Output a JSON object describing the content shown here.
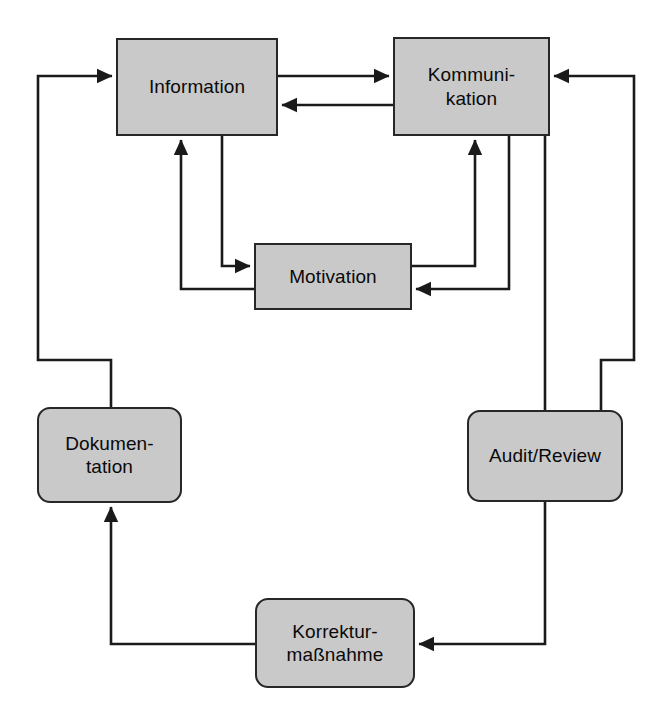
{
  "diagram": {
    "canvas": {
      "width": 656,
      "height": 722
    },
    "colors": {
      "node_fill": "#c9c9c9",
      "node_border": "#272727",
      "edge": "#1a1a1a",
      "background": "#ffffff"
    },
    "nodes": [
      {
        "id": "information",
        "label": "Information",
        "shape": "rectangle",
        "x": 116,
        "y": 38,
        "w": 162,
        "h": 98
      },
      {
        "id": "kommunikation",
        "label": "Kommuni-\nkation",
        "shape": "rectangle",
        "x": 393,
        "y": 37,
        "w": 157,
        "h": 99
      },
      {
        "id": "motivation",
        "label": "Motivation",
        "shape": "rectangle",
        "x": 254,
        "y": 243,
        "w": 158,
        "h": 67
      },
      {
        "id": "dokumentation",
        "label": "Dokumen-\ntation",
        "shape": "rounded-rectangle",
        "x": 37,
        "y": 407,
        "w": 145,
        "h": 96
      },
      {
        "id": "audit",
        "label": "Audit/Review",
        "shape": "rounded-rectangle",
        "x": 467,
        "y": 410,
        "w": 156,
        "h": 92
      },
      {
        "id": "korrektur",
        "label": "Korrektur-\nmaßnahme",
        "shape": "rounded-rectangle",
        "x": 255,
        "y": 598,
        "w": 160,
        "h": 90
      }
    ],
    "edges": [
      {
        "id": "information-to-kommunikation",
        "from": "information",
        "to": "kommunikation",
        "arrow": "single"
      },
      {
        "id": "kommunikation-to-information",
        "from": "kommunikation",
        "to": "information",
        "arrow": "single"
      },
      {
        "id": "information-to-motivation",
        "from": "information",
        "to": "motivation",
        "arrow": "single"
      },
      {
        "id": "motivation-to-information",
        "from": "motivation",
        "to": "information",
        "arrow": "single"
      },
      {
        "id": "motivation-to-kommunikation",
        "from": "motivation",
        "to": "kommunikation",
        "arrow": "single"
      },
      {
        "id": "kommunikation-to-motivation",
        "from": "kommunikation",
        "to": "motivation",
        "arrow": "single"
      },
      {
        "id": "kommunikation-to-audit",
        "from": "kommunikation",
        "to": "audit",
        "arrow": "none"
      },
      {
        "id": "audit-to-korrektur",
        "from": "audit",
        "to": "korrektur",
        "arrow": "single"
      },
      {
        "id": "korrektur-to-dokumentation",
        "from": "korrektur",
        "to": "dokumentation",
        "arrow": "single"
      },
      {
        "id": "dokumentation-to-information",
        "from": "dokumentation",
        "to": "information",
        "arrow": "single"
      },
      {
        "id": "audit-feedback-to-kommunikation",
        "from": "audit",
        "to": "kommunikation",
        "arrow": "single"
      }
    ]
  }
}
